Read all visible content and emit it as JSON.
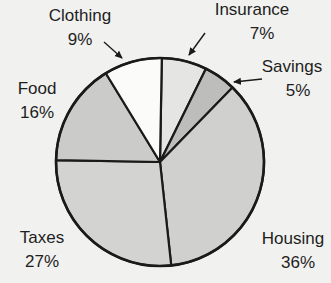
{
  "chart_data": {
    "type": "pie",
    "title": "",
    "start_angle_deg": 1,
    "direction": "clockwise",
    "slices": [
      {
        "key": "insurance",
        "label": "Insurance",
        "value": 7,
        "display": "7%",
        "color": "#e5e5e3"
      },
      {
        "key": "savings",
        "label": "Savings",
        "value": 5,
        "display": "5%",
        "color": "#bdbdbb"
      },
      {
        "key": "housing",
        "label": "Housing",
        "value": 36,
        "display": "36%",
        "color": "#d0d0ce"
      },
      {
        "key": "taxes",
        "label": "Taxes",
        "value": 27,
        "display": "27%",
        "color": "#d3d3d1"
      },
      {
        "key": "food",
        "label": "Food",
        "value": 16,
        "display": "16%",
        "color": "#cbcbc9"
      },
      {
        "key": "clothing",
        "label": "Clothing",
        "value": 9,
        "display": "9%",
        "color": "#fbfbfa"
      }
    ],
    "categories": [
      "Insurance",
      "Savings",
      "Housing",
      "Taxes",
      "Food",
      "Clothing"
    ],
    "values": [
      7,
      5,
      36,
      27,
      16,
      9
    ],
    "unit": "%"
  },
  "labels": {
    "clothing": {
      "name": "Clothing",
      "pct": "9%"
    },
    "insurance": {
      "name": "Insurance",
      "pct": "7%"
    },
    "savings": {
      "name": "Savings",
      "pct": "5%"
    },
    "food": {
      "name": "Food",
      "pct": "16%"
    },
    "taxes": {
      "name": "Taxes",
      "pct": "27%"
    },
    "housing": {
      "name": "Housing",
      "pct": "36%"
    }
  },
  "style": {
    "background": "#f1f1ef",
    "stroke": "#1a1a1a"
  }
}
